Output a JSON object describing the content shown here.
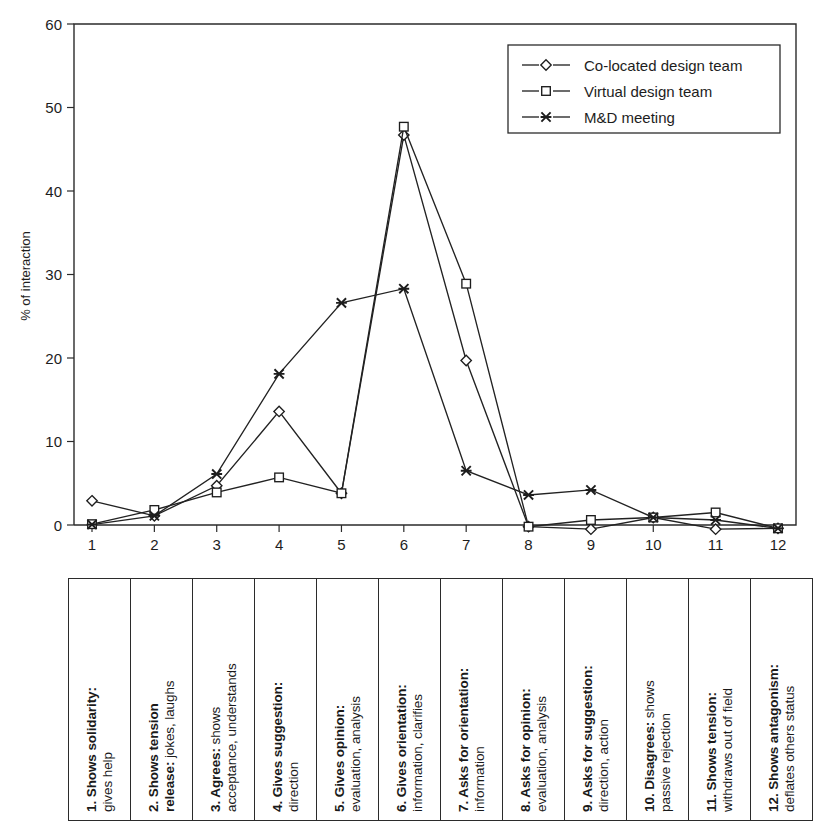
{
  "chart_data": {
    "type": "line",
    "title": "",
    "xlabel": "",
    "ylabel": "% of interaction",
    "ylim": [
      0,
      60
    ],
    "yticks": [
      0,
      10,
      20,
      30,
      40,
      50,
      60
    ],
    "xticks": [
      "1",
      "2",
      "3",
      "4",
      "5",
      "6",
      "7",
      "8",
      "9",
      "10",
      "11",
      "12"
    ],
    "grid": false,
    "legend_position": "top-right",
    "categories": [
      "1",
      "2",
      "3",
      "4",
      "5",
      "6",
      "7",
      "8",
      "9",
      "10",
      "11",
      "12"
    ],
    "series": [
      {
        "name": "Co-located design team",
        "marker": "diamond",
        "values": [
          2.9,
          1.1,
          4.7,
          13.6,
          3.8,
          46.7,
          19.7,
          -0.2,
          -0.5,
          0.9,
          -0.5,
          -0.4
        ]
      },
      {
        "name": "Virtual design team",
        "marker": "square",
        "values": [
          0.1,
          1.8,
          3.9,
          5.7,
          3.8,
          47.7,
          28.9,
          -0.2,
          0.6,
          0.9,
          1.5,
          -0.4
        ]
      },
      {
        "name": "M&D meeting",
        "marker": "x",
        "values": [
          0.05,
          1.1,
          6.1,
          18.1,
          26.6,
          28.3,
          6.5,
          3.6,
          4.2,
          0.9,
          0.6,
          -0.4
        ]
      }
    ]
  },
  "yaxis": {
    "label": "% of interaction",
    "ticks": [
      "60",
      "50",
      "40",
      "30",
      "20",
      "10",
      "0"
    ]
  },
  "xaxis": {
    "ticks": [
      "1",
      "2",
      "3",
      "4",
      "5",
      "6",
      "7",
      "8",
      "9",
      "10",
      "11",
      "12"
    ]
  },
  "legend": {
    "entries": [
      {
        "label": "Co-located design team",
        "marker": "diamond"
      },
      {
        "label": "Virtual design team",
        "marker": "square"
      },
      {
        "label": "M&D meeting",
        "marker": "x"
      }
    ]
  },
  "category_table": {
    "cells": [
      {
        "num": "1. Shows solidarity",
        "desc": "gives help",
        "wrap": false
      },
      {
        "num": "2. Shows tension release",
        "desc": "jokes, laughs",
        "wrap": true,
        "num_line1": "2. Shows tension",
        "num_line2": "release",
        "desc_on_line2": true
      },
      {
        "num": "3. Agrees",
        "desc": "shows acceptance, understands",
        "wrap": true,
        "desc_line1": "shows",
        "desc_line2": "acceptance, understands"
      },
      {
        "num": "4. Gives suggestion",
        "desc": "direction",
        "wrap": false
      },
      {
        "num": "5. Gives opinion",
        "desc": "evaluation, analysis",
        "wrap": false
      },
      {
        "num": "6. Gives orientation",
        "desc": "information, clarifies",
        "wrap": false
      },
      {
        "num": "7. Asks for orientation",
        "desc": "information",
        "wrap": false
      },
      {
        "num": "8. Asks for opinion",
        "desc": "evaluation, analysis",
        "wrap": false
      },
      {
        "num": "9. Asks for suggestion",
        "desc": "direction, action",
        "wrap": false
      },
      {
        "num": "10. Disagrees",
        "desc": "shows passive rejection",
        "wrap": true,
        "desc_line1": "shows",
        "desc_line2": "passive rejection"
      },
      {
        "num": "11. Shows tension",
        "desc": "withdraws out of field",
        "wrap": false
      },
      {
        "num": "12. Shows antagonism",
        "desc": "deflates others status",
        "wrap": false
      }
    ]
  },
  "colors": {
    "line": "#222222",
    "frame": "#2b2b2b",
    "text": "#1d1d1d",
    "background": "#ffffff"
  }
}
